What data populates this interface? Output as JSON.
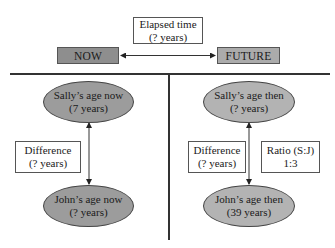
{
  "diagram": {
    "colors": {
      "now_fill": "#8e8e8e",
      "future_fill": "#ababab",
      "now_ellipse_fill": "#9c9c9c",
      "future_ellipse_fill": "#b3b3b3",
      "line": "#333333"
    },
    "timeline": {
      "elapsed": {
        "line1": "Elapsed time",
        "line2": "(? years)"
      },
      "now_label": "NOW",
      "future_label": "FUTURE"
    },
    "now_panel": {
      "sally": {
        "line1": "Sally’s age now",
        "line2": "(7 years)"
      },
      "difference": {
        "line1": "Difference",
        "line2": "(? years)"
      },
      "john": {
        "line1": "John’s age now",
        "line2": "(? years)"
      }
    },
    "future_panel": {
      "sally": {
        "line1": "Sally’s age then",
        "line2": "(? years)"
      },
      "difference": {
        "line1": "Difference",
        "line2": "(? years)"
      },
      "ratio": {
        "line1": "Ratio (S:J)",
        "line2": "1:3"
      },
      "john": {
        "line1": "John’s age then",
        "line2": "(39 years)"
      }
    }
  }
}
